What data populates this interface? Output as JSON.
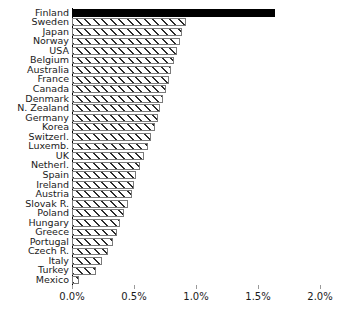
{
  "chart_data": {
    "type": "bar",
    "orientation": "horizontal",
    "title": "",
    "subtitle": "",
    "xlabel": "",
    "ylabel": "",
    "xlim": [
      0.0,
      2.0
    ],
    "xticks": [
      0.0,
      0.5,
      1.0,
      1.5,
      2.0
    ],
    "xtick_labels": [
      "0.0%",
      "0.5%",
      "1.0%",
      "1.5%",
      "2.0%"
    ],
    "grid": false,
    "legend": null,
    "value_format": "percent",
    "highlight_category": "Finland",
    "colors": {
      "highlight_fill": "#000000",
      "bar_fill": "#ffffff",
      "bar_edge": "#7a7a7a",
      "hatch_color": "#2b2b2b",
      "axis": "#000000",
      "text": "#1a1a1a",
      "background": "#ffffff"
    },
    "categories": [
      "Finland",
      "Sweden",
      "Japan",
      "Norway",
      "USA",
      "Belgium",
      "Australia",
      "France",
      "Canada",
      "Denmark",
      "N. Zealand",
      "Germany",
      "Korea",
      "Switzerl.",
      "Luxemb.",
      "UK",
      "Netherl.",
      "Spain",
      "Ireland",
      "Austria",
      "Slovak R.",
      "Poland",
      "Hungary",
      "Greece",
      "Portugal",
      "Czech R.",
      "Italy",
      "Turkey",
      "Mexico"
    ],
    "values": [
      1.64,
      0.92,
      0.89,
      0.87,
      0.85,
      0.82,
      0.8,
      0.78,
      0.76,
      0.73,
      0.71,
      0.69,
      0.67,
      0.64,
      0.61,
      0.58,
      0.55,
      0.52,
      0.5,
      0.48,
      0.45,
      0.42,
      0.39,
      0.36,
      0.33,
      0.29,
      0.24,
      0.19,
      0.06
    ]
  }
}
